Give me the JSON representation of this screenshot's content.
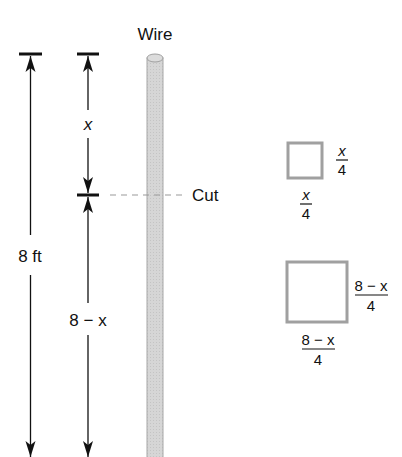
{
  "figure": {
    "title_partial": "",
    "wire_label": "Wire",
    "cut_label": "Cut",
    "total_length_label": "8 ft",
    "top_segment_label": "x",
    "bottom_segment_label": "8 − x",
    "small_square": {
      "side_label_numerator": "x",
      "side_label_denominator": "4",
      "bottom_label_numerator": "x",
      "bottom_label_denominator": "4"
    },
    "large_square": {
      "side_label_numerator": "8 − x",
      "side_label_denominator": "4",
      "bottom_label_numerator": "8 − x",
      "bottom_label_denominator": "4"
    },
    "colors": {
      "wire_fill": "#d4d4d4",
      "wire_stroke": "#a8a8a8",
      "square_stroke": "#a0a0a0",
      "dash_line": "#9a9a9a",
      "ink": "#111111"
    }
  }
}
